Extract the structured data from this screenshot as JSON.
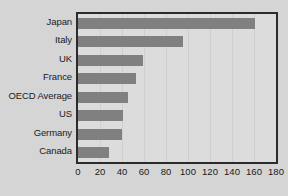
{
  "chart_data": {
    "type": "bar",
    "orientation": "horizontal",
    "title": "",
    "subtitle": "",
    "xlabel": "",
    "ylabel": "",
    "categories": [
      "Japan",
      "Italy",
      "UK",
      "France",
      "OECD Average",
      "US",
      "Germany",
      "Canada"
    ],
    "values": [
      161,
      95,
      59,
      53,
      45,
      41,
      40,
      28
    ],
    "xlim": [
      0,
      180
    ],
    "ylim": null,
    "xticks": [
      0,
      20,
      40,
      60,
      80,
      100,
      120,
      140,
      160,
      180
    ],
    "xtick_labels": [
      "0",
      "20",
      "40",
      "60",
      "80",
      "100",
      "120",
      "140",
      "160",
      "180"
    ],
    "grid": true,
    "grid_axis": "x",
    "legend": false,
    "legend_position": "none",
    "series": [
      {
        "name": "",
        "values": [
          161,
          95,
          59,
          53,
          45,
          41,
          40,
          28
        ]
      }
    ]
  },
  "style": {
    "page_background": "#d5d5d5",
    "plot_background": "#dcdcdc",
    "bar_color": "#808080",
    "frame_color": "#2b2b2b",
    "grid_color": "#cfcfcf",
    "text_color": "#1a1a1a"
  }
}
